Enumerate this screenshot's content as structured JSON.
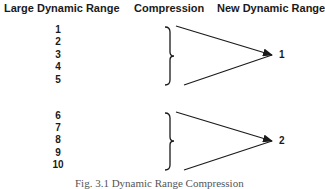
{
  "headers": {
    "input": "Large Dynamic Range",
    "process": "Compression",
    "output": "New Dynamic Range"
  },
  "groups": [
    {
      "inputs": [
        "1",
        "2",
        "3",
        "4",
        "5"
      ],
      "output": "1"
    },
    {
      "inputs": [
        "6",
        "7",
        "8",
        "9",
        "10"
      ],
      "output": "2"
    }
  ],
  "caption": "Fig. 3.1 Dynamic Range Compression"
}
